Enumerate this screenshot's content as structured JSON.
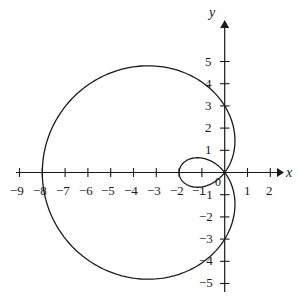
{
  "chart_data": {
    "type": "line",
    "title": "",
    "subtitle": "",
    "xlabel": "x",
    "ylabel": "y",
    "curve_name": "limacon-with-inner-loop",
    "equation": "r = 3 + 5 cos(theta), reflected about the y-axis",
    "grid": false,
    "legend": "none",
    "xlim": [
      -9.9,
      2.6
    ],
    "ylim": [
      -5.7,
      5.8
    ],
    "x_ticks": [
      -9,
      -8,
      -7,
      -6,
      -5,
      -4,
      -3,
      -2,
      -1,
      1,
      2
    ],
    "x_tick_labels": [
      "−9",
      "−8",
      "−7",
      "−6",
      "−5",
      "−4",
      "−3",
      "−2",
      "−1",
      "1",
      "2"
    ],
    "y_ticks": [
      5,
      4,
      3,
      2,
      1,
      -1,
      -2,
      -3,
      -4,
      -5
    ],
    "y_tick_labels": [
      "5",
      "4",
      "3",
      "2",
      "1",
      "−1",
      "−2",
      "−3",
      "−4",
      "−5"
    ],
    "origin_label": "0",
    "axis_color": "#1a1a1a",
    "curve_color": "#1a1a1a",
    "background_color": "#ffffff",
    "outer_loop": {
      "x_axis_crossing": -8,
      "max_y": 4.8,
      "min_y": -4.8,
      "apex_x": -3.45
    },
    "inner_loop": {
      "x_axis_crossing": -2,
      "max_y": 0.65,
      "min_y": -0.65
    },
    "key_points": [
      {
        "x": 0,
        "y": 0,
        "note": "node / origin"
      },
      {
        "x": -8,
        "y": 0,
        "note": "outer loop tip"
      },
      {
        "x": -2,
        "y": 0,
        "note": "inner loop tip"
      },
      {
        "x": -3.45,
        "y": 4.8,
        "note": "upper extreme"
      },
      {
        "x": -3.45,
        "y": -4.8,
        "note": "lower extreme"
      },
      {
        "x": 0,
        "y": 3,
        "note": "curve crosses y axis"
      },
      {
        "x": 0,
        "y": -3,
        "note": "curve crosses y axis"
      }
    ]
  }
}
